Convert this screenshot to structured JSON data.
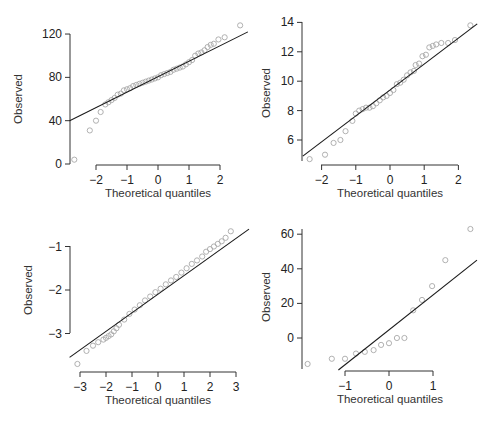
{
  "chart_data": [
    {
      "type": "scatter",
      "subtype": "normal-qq-plot",
      "panel": "top-left",
      "title": "",
      "xlabel": "Theoretical quantiles",
      "ylabel": "Observed",
      "xticks": [
        -2,
        -1,
        0,
        1,
        2
      ],
      "yticks": [
        0,
        40,
        80,
        120
      ],
      "xlim": [
        -2.85,
        2.9
      ],
      "ylim": [
        0,
        128
      ],
      "grid": false,
      "reference_line": {
        "x": [
          -2.85,
          2.9
        ],
        "y": [
          40,
          122
        ]
      },
      "points": {
        "x": [
          -2.7,
          -2.2,
          -2.0,
          -1.85,
          -1.7,
          -1.6,
          -1.5,
          -1.4,
          -1.3,
          -1.2,
          -1.1,
          -1.0,
          -0.9,
          -0.8,
          -0.7,
          -0.6,
          -0.5,
          -0.4,
          -0.3,
          -0.2,
          -0.1,
          0.0,
          0.1,
          0.2,
          0.3,
          0.4,
          0.5,
          0.6,
          0.7,
          0.8,
          0.9,
          1.0,
          1.1,
          1.2,
          1.3,
          1.4,
          1.5,
          1.6,
          1.7,
          1.8,
          1.95,
          2.15,
          2.65
        ],
        "y": [
          4,
          31,
          40,
          48,
          55,
          57,
          59,
          61,
          64,
          65,
          68,
          69,
          70,
          72,
          73,
          74,
          75,
          76,
          77,
          78,
          79,
          80,
          82,
          83,
          84,
          85,
          87,
          88,
          89,
          90,
          92,
          94,
          96,
          100,
          102,
          103,
          105,
          108,
          110,
          111,
          115,
          117,
          128
        ]
      }
    },
    {
      "type": "scatter",
      "subtype": "normal-qq-plot",
      "panel": "top-right",
      "title": "",
      "xlabel": "Theoretical quantiles",
      "ylabel": "Observed",
      "xticks": [
        -2,
        -1,
        0,
        1,
        2
      ],
      "yticks": [
        6,
        8,
        10,
        12,
        14
      ],
      "xlim": [
        -2.55,
        2.55
      ],
      "ylim": [
        4.6,
        14.1
      ],
      "grid": false,
      "reference_line": {
        "x": [
          -2.55,
          2.55
        ],
        "y": [
          4.9,
          13.9
        ]
      },
      "points": {
        "x": [
          -2.35,
          -1.9,
          -1.65,
          -1.45,
          -1.3,
          -1.1,
          -1.0,
          -0.9,
          -0.8,
          -0.7,
          -0.6,
          -0.5,
          -0.4,
          -0.3,
          -0.2,
          -0.1,
          0.0,
          0.1,
          0.2,
          0.3,
          0.4,
          0.5,
          0.6,
          0.7,
          0.75,
          0.85,
          0.95,
          1.05,
          1.15,
          1.25,
          1.35,
          1.5,
          1.7,
          1.9,
          2.35
        ],
        "y": [
          4.7,
          5.0,
          5.8,
          6.0,
          6.6,
          7.3,
          7.8,
          8.0,
          8.1,
          8.2,
          8.2,
          8.3,
          8.5,
          8.7,
          8.9,
          9.0,
          9.2,
          9.4,
          9.8,
          9.9,
          10.1,
          10.4,
          10.6,
          10.7,
          11.1,
          11.2,
          11.7,
          11.8,
          12.3,
          12.4,
          12.5,
          12.6,
          12.6,
          12.8,
          13.8
        ]
      }
    },
    {
      "type": "scatter",
      "subtype": "normal-qq-plot",
      "panel": "bottom-left",
      "title": "",
      "xlabel": "Theoretical quantiles",
      "ylabel": "Observed",
      "xticks": [
        -3,
        -2,
        -1,
        0,
        1,
        2,
        3
      ],
      "yticks": [
        -3,
        -2,
        -1
      ],
      "xlim": [
        -3.4,
        3.5
      ],
      "ylim": [
        -3.8,
        -0.55
      ],
      "grid": false,
      "reference_line": {
        "x": [
          -3.4,
          3.5
        ],
        "y": [
          -3.55,
          -0.6
        ]
      },
      "points": {
        "x": [
          -3.1,
          -2.75,
          -2.5,
          -2.3,
          -2.1,
          -2.0,
          -1.9,
          -1.8,
          -1.7,
          -1.6,
          -1.5,
          -1.3,
          -1.1,
          -0.9,
          -0.7,
          -0.5,
          -0.3,
          -0.1,
          0.1,
          0.3,
          0.5,
          0.7,
          0.9,
          1.1,
          1.3,
          1.5,
          1.7,
          1.85,
          2.0,
          2.15,
          2.3,
          2.45,
          2.6,
          2.8
        ],
        "y": [
          -3.7,
          -3.4,
          -3.28,
          -3.2,
          -3.14,
          -3.1,
          -3.06,
          -3.02,
          -2.95,
          -2.88,
          -2.8,
          -2.68,
          -2.55,
          -2.45,
          -2.35,
          -2.24,
          -2.15,
          -2.05,
          -1.97,
          -1.87,
          -1.78,
          -1.7,
          -1.6,
          -1.5,
          -1.4,
          -1.32,
          -1.23,
          -1.12,
          -1.06,
          -1.0,
          -0.94,
          -0.88,
          -0.8,
          -0.65
        ]
      }
    },
    {
      "type": "scatter",
      "subtype": "normal-qq-plot",
      "panel": "bottom-right",
      "title": "",
      "xlabel": "Theoretical quantiles",
      "ylabel": "Observed",
      "xticks": [
        -1,
        0,
        1
      ],
      "yticks": [
        0,
        20,
        40,
        60
      ],
      "xlim": [
        -1.95,
        2.1
      ],
      "ylim": [
        -19,
        66
      ],
      "grid": false,
      "reference_line": {
        "x": [
          -1.15,
          2.0
        ],
        "y": [
          -18.5,
          45
        ]
      },
      "points": {
        "x": [
          -1.85,
          -1.3,
          -1.0,
          -0.75,
          -0.55,
          -0.35,
          -0.18,
          0.0,
          0.18,
          0.35,
          0.55,
          0.75,
          0.98,
          1.28,
          1.85
        ],
        "y": [
          -15,
          -12,
          -12,
          -9,
          -8,
          -7,
          -4,
          -3,
          0,
          0,
          16,
          22,
          30,
          45,
          63
        ]
      }
    }
  ],
  "labels": {
    "xlabel": "Theoretical quantiles",
    "ylabel": "Observed"
  },
  "colors": {
    "points": "#a8a8a8",
    "line": "#1a1a1a",
    "axis": "#333333"
  }
}
